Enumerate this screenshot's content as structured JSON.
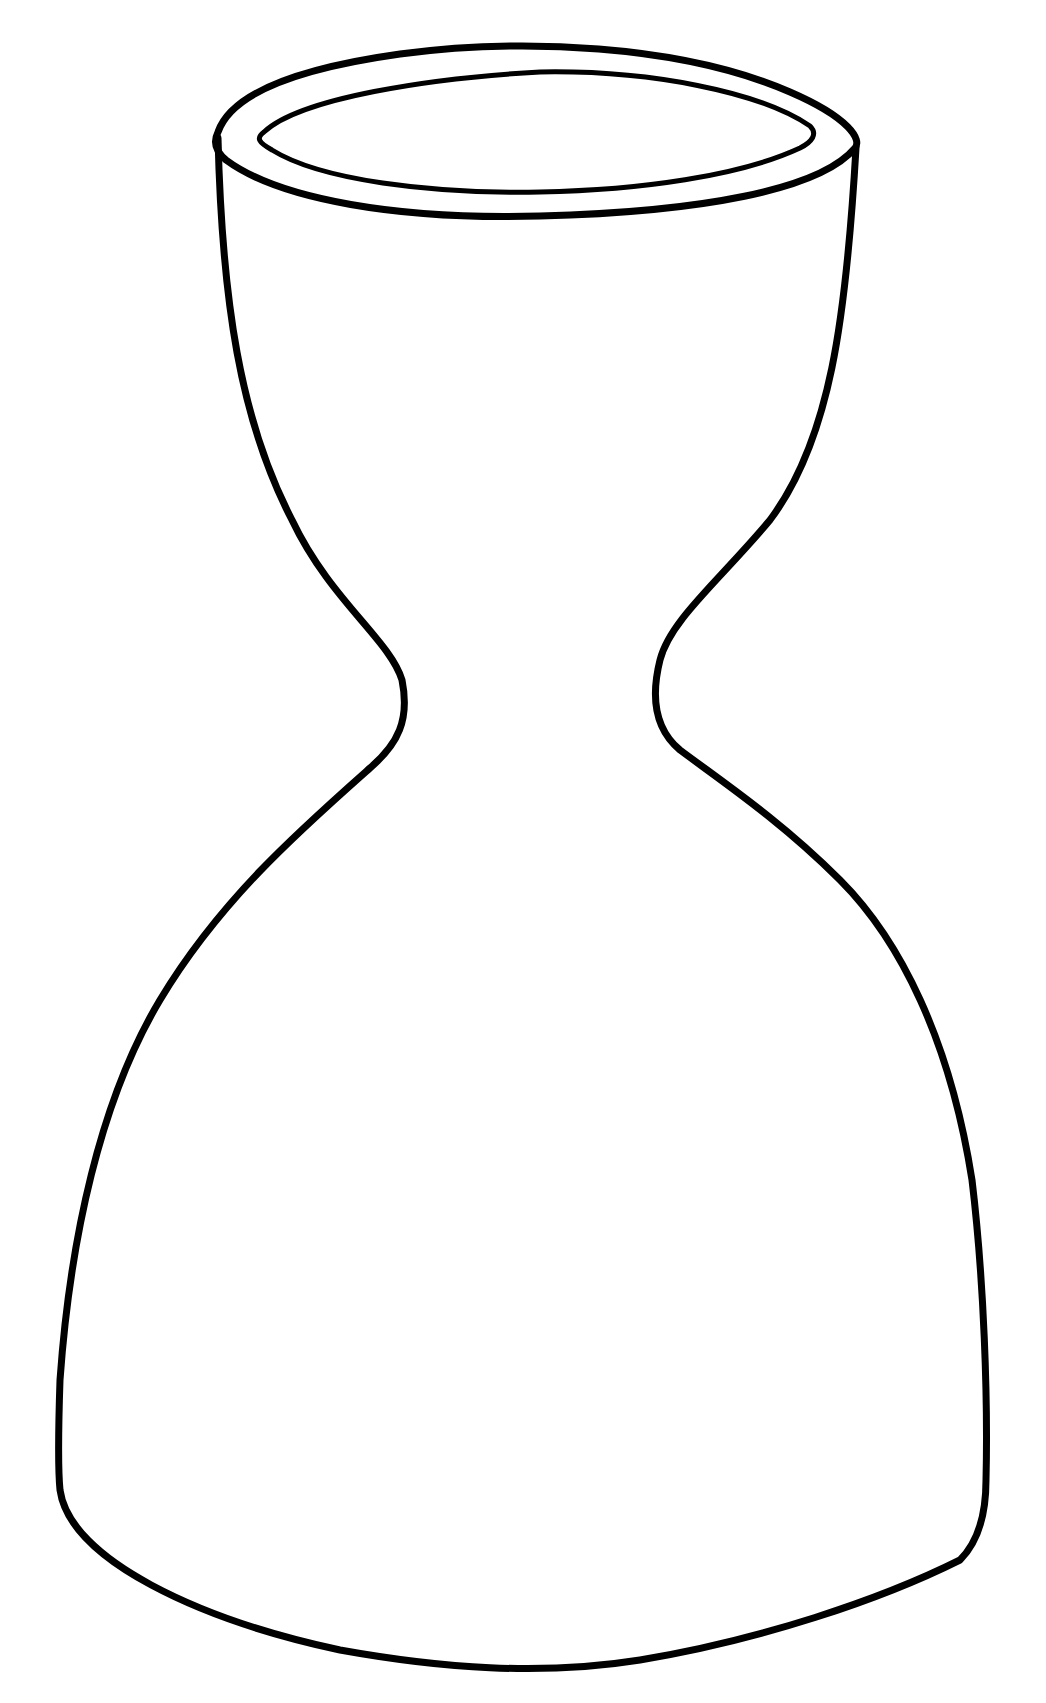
{
  "image": {
    "subject": "vase outline drawing",
    "width": 1046,
    "height": 1703,
    "background_color": "#ffffff",
    "stroke_color": "#000000"
  },
  "drawing": {
    "rim_outer": {
      "d": "M 218 132 C 232 92, 300 68, 400 54 C 520 38, 680 44, 790 92 C 850 118, 862 140, 855 148 C 820 190, 700 212, 540 216 C 400 220, 280 200, 226 160 C 214 150, 214 140, 218 132 Z",
      "stroke_width": 7
    },
    "rim_inner": {
      "d": "M 264 132 C 300 98, 430 78, 540 72 C 650 70, 760 92, 810 126 C 818 134, 812 142, 800 148 C 740 176, 640 190, 540 192 C 430 194, 320 180, 272 150 C 258 142, 256 138, 264 132 Z",
      "stroke_width": 5
    },
    "body": {
      "d": "M 218 138 C 222 300, 240 420, 292 520 C 330 600, 390 640, 402 680 C 410 720, 398 744, 370 768 C 300 830, 220 900, 160 1000 C 100 1100, 70 1240, 60 1380 C 58 1440, 58 1470, 60 1490 C 70 1560, 200 1620, 340 1650 C 440 1668, 540 1676, 640 1660 C 760 1640, 880 1600, 960 1560 C 980 1540, 986 1510, 986 1480 C 988 1400, 984 1280, 972 1180 C 950 1040, 900 940, 840 880 C 780 820, 720 780, 680 750 C 656 730, 650 700, 660 660 C 670 620, 720 580, 770 520 C 830 440, 846 320, 856 148",
      "stroke_width": 7
    }
  }
}
